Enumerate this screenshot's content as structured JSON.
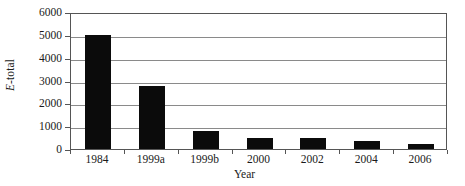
{
  "chart_data": {
    "type": "bar",
    "title": "",
    "xlabel": "Year",
    "ylabel": "E-total",
    "ylabel_italic_prefix": "E",
    "ylabel_rest": "-total",
    "categories": [
      "1984",
      "1999a",
      "1999b",
      "2000",
      "2002",
      "2004",
      "2006"
    ],
    "values": [
      5000,
      2750,
      780,
      500,
      480,
      330,
      220
    ],
    "ylim": [
      0,
      6000
    ],
    "ytick_labels": [
      "6000",
      "5000",
      "4000",
      "3000",
      "2000",
      "1000",
      "0"
    ],
    "ytick_values": [
      6000,
      5000,
      4000,
      3000,
      2000,
      1000,
      0
    ],
    "grid": true,
    "grid_axis": "y",
    "legend": null,
    "bar_color": "#0b0b0b",
    "grid_color": "#8a8a8a",
    "frame_color": "#555555",
    "background_color": "#ffffff"
  }
}
